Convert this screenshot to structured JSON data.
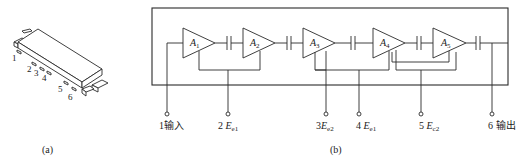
{
  "figure_a": {
    "caption": "(a)",
    "pin_numbers": [
      "1",
      "2",
      "3",
      "4",
      "5",
      "6"
    ]
  },
  "figure_b": {
    "caption": "(b)",
    "amplifiers": [
      {
        "name": "A",
        "sub": "1"
      },
      {
        "name": "A",
        "sub": "2"
      },
      {
        "name": "A",
        "sub": "3"
      },
      {
        "name": "A",
        "sub": "4"
      },
      {
        "name": "A",
        "sub": "5"
      }
    ],
    "pins": [
      {
        "num": "1",
        "text": "输入",
        "sym": "",
        "sub": ""
      },
      {
        "num": "2 ",
        "text": "",
        "sym": "E",
        "sub": "e1"
      },
      {
        "num": "3",
        "text": "",
        "sym": "E",
        "sub": "e2"
      },
      {
        "num": "4 ",
        "text": "",
        "sym": "E",
        "sub": "e1"
      },
      {
        "num": "5 ",
        "text": "",
        "sym": "E",
        "sub": "c2"
      },
      {
        "num": "6 ",
        "text": "输出",
        "sym": "",
        "sub": ""
      }
    ]
  },
  "colors": {
    "line": "#2a2a2a",
    "background": "#ffffff"
  }
}
